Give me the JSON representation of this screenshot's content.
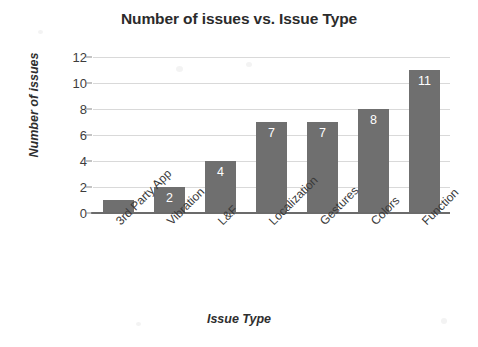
{
  "chart_data": {
    "type": "bar",
    "title": "Number of issues vs. Issue Type",
    "xlabel": "Issue Type",
    "ylabel": "Number of issues",
    "categories": [
      "3rd Party App",
      "Vibration",
      "L&F",
      "Localization",
      "Gestures",
      "Colors",
      "Function"
    ],
    "values": [
      1,
      2,
      4,
      7,
      7,
      8,
      11
    ],
    "value_labels": [
      "",
      "2",
      "4",
      "7",
      "7",
      "8",
      "11"
    ],
    "ylim": [
      0,
      12
    ],
    "ytick_labels": [
      "0",
      "2",
      "4",
      "6",
      "8",
      "10",
      "12"
    ],
    "ytick_values": [
      0,
      2,
      4,
      6,
      8,
      10,
      12
    ],
    "grid": "horizontal",
    "legend": "none",
    "bar_color": "#6f6f6f",
    "grid_color": "#d9d9d9",
    "axis_color": "#6b6b6b",
    "value_label_color": "#ffffff",
    "title_color": "#2b2b2b",
    "background_color": "#ffffff"
  }
}
